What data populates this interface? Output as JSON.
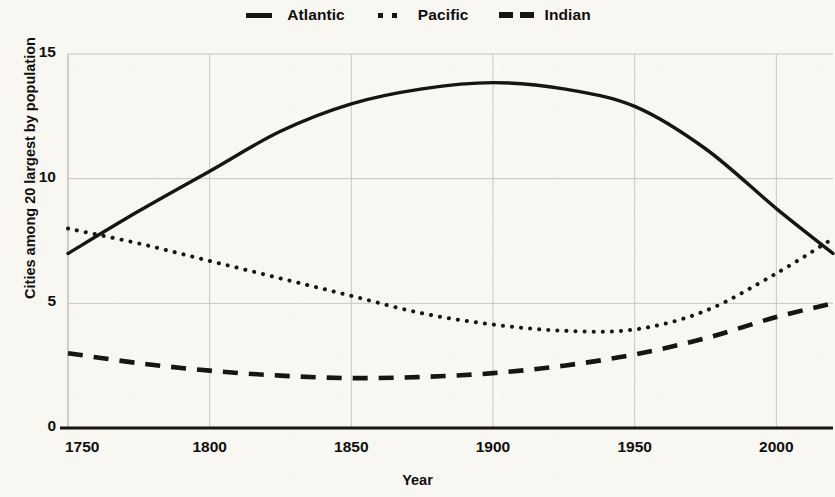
{
  "chart_data": {
    "type": "line",
    "title": "",
    "xlabel": "Year",
    "ylabel": "Cities among 20 largest by population",
    "xlim": [
      1750,
      2020
    ],
    "ylim": [
      0,
      15
    ],
    "xticks": [
      1750,
      1800,
      1850,
      1900,
      1950,
      2000
    ],
    "xtick_labels": [
      "1750",
      "1800",
      "1850",
      "1900",
      "1950",
      "2000"
    ],
    "yticks": [
      0,
      5,
      10,
      15
    ],
    "ytick_labels": [
      "0",
      "5",
      "10",
      "15"
    ],
    "grid": true,
    "legend_position": "top-center",
    "x": [
      1750,
      1775,
      1800,
      1825,
      1850,
      1875,
      1900,
      1925,
      1950,
      1975,
      2000,
      2020
    ],
    "series": [
      {
        "name": "Atlantic",
        "linestyle": "solid",
        "color": "#171512",
        "values": [
          7.0,
          8.7,
          10.3,
          11.9,
          13.0,
          13.6,
          13.85,
          13.6,
          12.9,
          11.2,
          8.8,
          7.0
        ]
      },
      {
        "name": "Pacific",
        "linestyle": "dotted",
        "color": "#171512",
        "values": [
          8.0,
          7.4,
          6.7,
          6.0,
          5.3,
          4.6,
          4.15,
          3.9,
          3.95,
          4.7,
          6.2,
          7.6
        ]
      },
      {
        "name": "Indian",
        "linestyle": "dashed",
        "color": "#171512",
        "values": [
          3.0,
          2.6,
          2.3,
          2.1,
          2.0,
          2.05,
          2.2,
          2.5,
          2.95,
          3.6,
          4.45,
          5.0
        ]
      }
    ]
  },
  "legend": {
    "entries": [
      {
        "label": "Atlantic",
        "key": "solid-line-key"
      },
      {
        "label": "Pacific",
        "key": "dotted-line-key"
      },
      {
        "label": "Indian",
        "key": "dashed-line-key"
      }
    ]
  },
  "axes": {
    "x_title": "Year",
    "y_title": "Cities among 20 largest by population"
  },
  "colors": {
    "ink": "#171512",
    "background": "#f8f7f2",
    "gridline": "#c9c6bb",
    "axis": "#100f0d"
  }
}
